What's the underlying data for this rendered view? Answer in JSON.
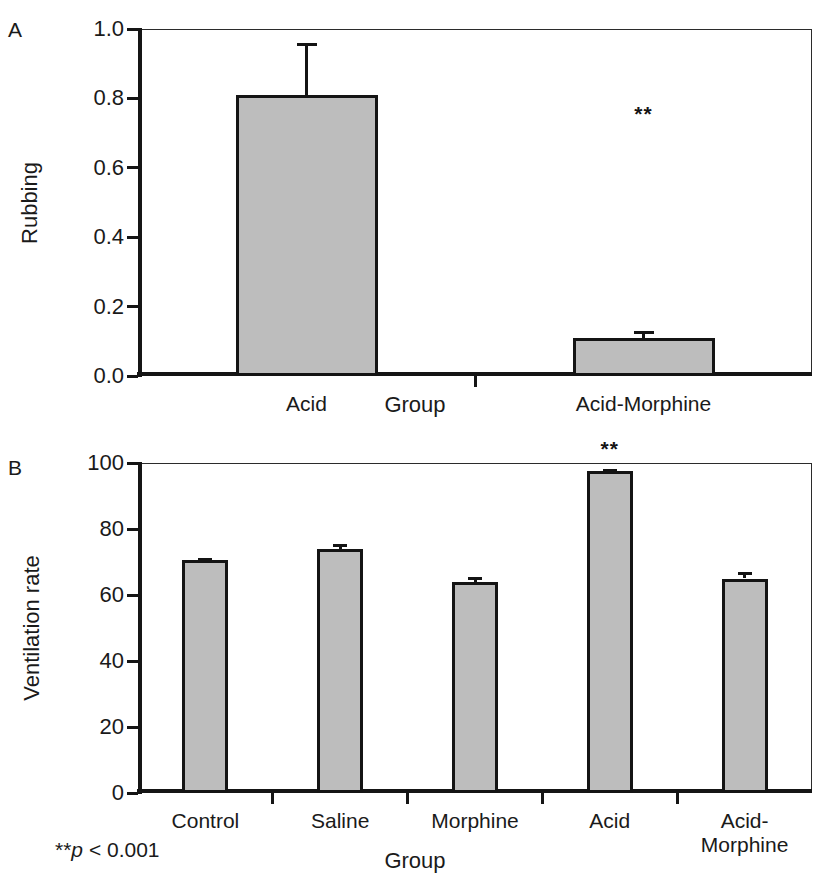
{
  "figure": {
    "background": "#ffffff",
    "bar_fill": "#bdbdbd",
    "bar_stroke": "#141414",
    "axis_color": "#151515"
  },
  "panel_a": {
    "letter": "A",
    "chart_data": {
      "type": "bar",
      "title": "",
      "categories": [
        "Acid",
        "Acid-Morphine"
      ],
      "values": [
        0.81,
        0.11
      ],
      "errors": [
        0.15,
        0.02
      ],
      "xlabel": "Group",
      "ylabel": "Rubbing",
      "ylim": [
        0.0,
        1.0
      ],
      "yticks": [
        0.0,
        0.2,
        0.4,
        0.6,
        0.8,
        1.0
      ],
      "ytick_labels": [
        "0.0",
        "0.2",
        "0.4",
        "0.6",
        "0.8",
        "1.0"
      ],
      "grid": false,
      "legend": "none",
      "annotations": [
        {
          "text": "**",
          "category": "Acid-Morphine",
          "value": 0.72
        }
      ]
    }
  },
  "panel_b": {
    "letter": "B",
    "chart_data": {
      "type": "bar",
      "title": "",
      "categories": [
        "Control",
        "Saline",
        "Morphine",
        "Acid",
        "Acid-\nMorphine"
      ],
      "values": [
        70.5,
        74.0,
        64.0,
        97.5,
        65.0
      ],
      "errors": [
        0.8,
        1.5,
        1.5,
        0.6,
        2.0
      ],
      "xlabel": "Group",
      "ylabel": "Ventilation rate",
      "ylim": [
        0,
        100
      ],
      "yticks": [
        0,
        20,
        40,
        60,
        80,
        100
      ],
      "ytick_labels": [
        "0",
        "20",
        "40",
        "60",
        "80",
        "100"
      ],
      "grid": false,
      "legend": "none",
      "annotations": [
        {
          "text": "**",
          "category": "Acid",
          "value": 100
        }
      ]
    },
    "footnote": {
      "stars": "**",
      "p_symbol": "p",
      "rest": " < 0.001"
    }
  }
}
